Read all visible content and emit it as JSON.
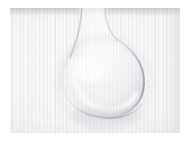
{
  "image": {
    "subject": "water-droplet-on-white-ribbed-fabric",
    "caption": "Macro photograph of a single water droplet resting on white ribbed cloth",
    "width_px": 192,
    "height_px": 143,
    "orientation": "landscape",
    "color_mode": "grayscale",
    "exposure": "high-key",
    "alt_text": "A pale, high-key close-up of a teardrop-shaped water droplet on finely ribbed white fabric"
  },
  "canvas": {
    "content_left_px": 10,
    "content_top_px": 8,
    "content_width_px": 170,
    "content_height_px": 125
  },
  "palette": {
    "paper_white": "#ffffff",
    "fabric_highlight": "#fdfdfd",
    "fabric_base": "#f8f8f8",
    "fabric_shade": "#ededee",
    "rib_line": "#babac0",
    "droplet_contour": "#b0b0b6",
    "droplet_contour_strong": "#a2a2a9",
    "stem_shadow": "#a8a8ae",
    "top_shade_band": "#96969c"
  },
  "subject_geometry": {
    "droplet_bulb_center_x_px": 90,
    "droplet_bulb_center_y_px": 70,
    "droplet_bulb_radius_px": 38,
    "stem_top_x_px": 80,
    "stem_top_y_px": 0,
    "stem_width_px": 26,
    "contour_strongest_side": "right"
  },
  "texture": {
    "type": "vertical-rib-wale",
    "direction": "vertical",
    "rib_pitch_px": 2.7,
    "coarse_group_pitch_px": 11
  },
  "regions": [
    {
      "name": "top-shade-band",
      "description": "Darker horizontal shadow along the upper edge of the cloth"
    },
    {
      "name": "droplet-stem",
      "description": "Narrow darker trail entering the frame from the top"
    },
    {
      "name": "droplet-bulb",
      "description": "Rounded body of the droplet in the lower-center"
    },
    {
      "name": "droplet-rim-right",
      "description": "Strongest, crispest contour line on the right side of the bulb"
    },
    {
      "name": "droplet-rim-bottom",
      "description": "Soft gray arc beneath the bulb"
    },
    {
      "name": "fabric-field",
      "description": "Surrounding expanse of bright ribbed cloth"
    }
  ]
}
